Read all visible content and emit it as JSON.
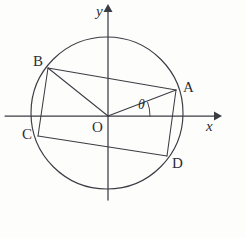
{
  "figure": {
    "background_color": "#fdfdfc",
    "ink_color": "#3b3b44"
  },
  "axes": {
    "x_axis": {
      "label": "x",
      "label_x": 206,
      "label_y": 119,
      "start_x": 5,
      "end_x": 218,
      "y": 116
    },
    "y_axis": {
      "label": "y",
      "label_x": 96,
      "label_y": 4,
      "x": 108,
      "start_y": 200,
      "end_y": 8
    },
    "origin": {
      "label": "O",
      "label_x": 92,
      "label_y": 120,
      "x": 108,
      "y": 116
    }
  },
  "circle": {
    "center_x": 107,
    "center_y": 113,
    "radius": 76
  },
  "angle": {
    "label": "θ",
    "label_x": 138,
    "label_y": 98,
    "arc_radius": 42,
    "start_deg": 0,
    "end_deg": 19
  },
  "points": [
    {
      "name": "A",
      "x": 176,
      "y": 90,
      "label_x": 183,
      "label_y": 80
    },
    {
      "name": "B",
      "x": 48,
      "y": 68,
      "label_x": 33,
      "label_y": 54
    },
    {
      "name": "C",
      "x": 38,
      "y": 136,
      "label_x": 22,
      "label_y": 127
    },
    {
      "name": "D",
      "x": 167,
      "y": 156,
      "label_x": 172,
      "label_y": 156
    }
  ],
  "segments": [
    {
      "name": "chord-BA",
      "from": "B",
      "to": "A",
      "x1": 48,
      "y1": 68,
      "x2": 176,
      "y2": 90
    },
    {
      "name": "chord-CD",
      "from": "C",
      "to": "D",
      "x1": 38,
      "y1": 136,
      "x2": 167,
      "y2": 156
    },
    {
      "name": "chord-BC",
      "from": "B",
      "to": "C",
      "x1": 48,
      "y1": 68,
      "x2": 38,
      "y2": 136
    },
    {
      "name": "chord-AD",
      "from": "A",
      "to": "D",
      "x1": 176,
      "y1": 90,
      "x2": 167,
      "y2": 156
    },
    {
      "name": "radius-OA",
      "from": "O",
      "to": "A",
      "x1": 108,
      "y1": 116,
      "x2": 176,
      "y2": 90
    },
    {
      "name": "radius-OB",
      "from": "O",
      "to": "B",
      "x1": 108,
      "y1": 116,
      "x2": 48,
      "y2": 68
    }
  ]
}
